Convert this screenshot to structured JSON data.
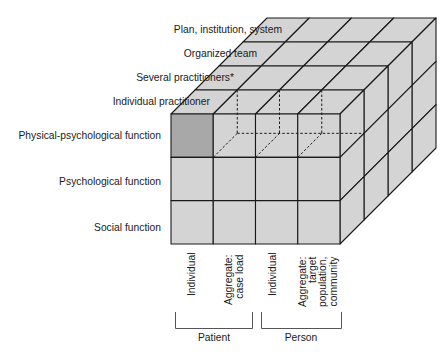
{
  "diagram": {
    "type": "3d-cube-matrix",
    "colors": {
      "cell_fill": "#d4d4d4",
      "highlight_fill": "#a8a8a8",
      "line": "#1a1a1a",
      "text": "#1a1a1a"
    },
    "depth_axis": {
      "labels": [
        "Individual practitioner",
        "Several practitioners*",
        "Organized team",
        "Plan, institution, system"
      ]
    },
    "row_axis": {
      "labels": [
        "Physical-psychological function",
        "Psychological function",
        "Social function"
      ]
    },
    "column_axis": {
      "columns": [
        {
          "lines": [
            "Individual"
          ]
        },
        {
          "lines": [
            "Aggregate:",
            "case load"
          ]
        },
        {
          "lines": [
            "Individual"
          ]
        },
        {
          "lines": [
            "Aggregate:",
            "target",
            "population,",
            "community"
          ]
        }
      ],
      "groups": [
        {
          "label": "Patient"
        },
        {
          "label": "Person"
        }
      ]
    },
    "highlighted_cell": {
      "row": "Physical-psychological function",
      "column": "Individual (Patient)",
      "depth": "Individual practitioner"
    }
  }
}
